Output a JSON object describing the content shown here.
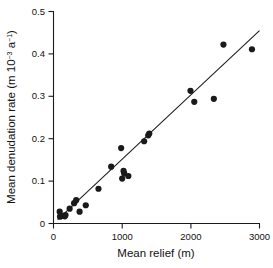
{
  "chart_data": {
    "type": "scatter",
    "title": "",
    "xlabel": "Mean relief (m)",
    "ylabel_parts": {
      "lead": "Mean denudation rate (m 10",
      "exp1": "−3",
      "mid": " a",
      "exp2": "−1",
      "tail": ")"
    },
    "ylabel": "Mean denudation rate (m 10-3 a-1)",
    "xlim": [
      0,
      3000
    ],
    "ylim": [
      0,
      0.5
    ],
    "xticks": [
      0,
      1000,
      2000,
      3000
    ],
    "xtick_labels": [
      "0",
      "1000",
      "2000",
      "3000"
    ],
    "yticks": [
      0,
      0.1,
      0.2,
      0.3,
      0.4,
      0.5
    ],
    "ytick_labels": [
      "0",
      "0.1",
      "0.2",
      "0.3",
      "0.4",
      "0.5"
    ],
    "grid": false,
    "legend": false,
    "marker": "filled-circle",
    "marker_color": "#1a1a1a",
    "marker_size_px": 3.1,
    "points": [
      {
        "x": 90,
        "y": 0.028
      },
      {
        "x": 95,
        "y": 0.016
      },
      {
        "x": 140,
        "y": 0.018
      },
      {
        "x": 165,
        "y": 0.017
      },
      {
        "x": 175,
        "y": 0.02
      },
      {
        "x": 235,
        "y": 0.035
      },
      {
        "x": 300,
        "y": 0.048
      },
      {
        "x": 330,
        "y": 0.055
      },
      {
        "x": 380,
        "y": 0.028
      },
      {
        "x": 470,
        "y": 0.043
      },
      {
        "x": 655,
        "y": 0.082
      },
      {
        "x": 840,
        "y": 0.134
      },
      {
        "x": 985,
        "y": 0.178
      },
      {
        "x": 1000,
        "y": 0.106
      },
      {
        "x": 1020,
        "y": 0.124
      },
      {
        "x": 1030,
        "y": 0.118
      },
      {
        "x": 1090,
        "y": 0.112
      },
      {
        "x": 1320,
        "y": 0.194
      },
      {
        "x": 1380,
        "y": 0.208
      },
      {
        "x": 1395,
        "y": 0.212
      },
      {
        "x": 1995,
        "y": 0.313
      },
      {
        "x": 2050,
        "y": 0.287
      },
      {
        "x": 2335,
        "y": 0.294
      },
      {
        "x": 2475,
        "y": 0.422
      },
      {
        "x": 2890,
        "y": 0.411
      }
    ],
    "trend_line": {
      "label": "regression line",
      "x_start": 60,
      "y_start": 0.009,
      "x_end": 3000,
      "y_end": 0.455,
      "slope_per_m": 0.0001517,
      "intercept": -0.0001
    },
    "colors": {
      "ink": "#1a1a1a",
      "background": "#ffffff"
    }
  }
}
